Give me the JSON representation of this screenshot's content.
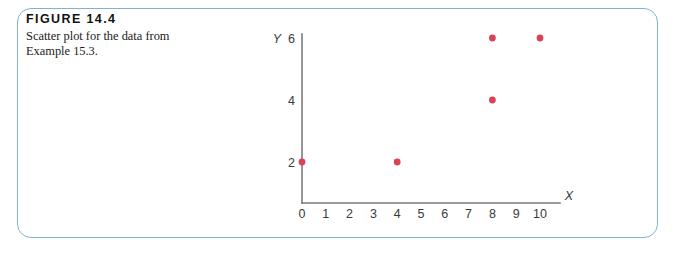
{
  "figure": {
    "number_label": "FIGURE 14.4",
    "caption_line_1": "Scatter plot for the data from",
    "caption_line_2": "Example 15.3.",
    "border_color": "#7fb4cc"
  },
  "chart_data": {
    "type": "scatter",
    "title": "",
    "xlabel": "X",
    "ylabel": "Y",
    "xlim": [
      0,
      10
    ],
    "ylim": [
      0,
      7
    ],
    "grid": false,
    "legend": false,
    "point_color": "#d94455",
    "axis_color": "#7b7b7b",
    "x_tick_labels": [
      "0",
      "1",
      "2",
      "3",
      "4",
      "5",
      "6",
      "7",
      "8",
      "9",
      "10"
    ],
    "x_ticks": [
      0,
      1,
      2,
      3,
      4,
      5,
      6,
      7,
      8,
      9,
      10
    ],
    "y_tick_labels": [
      "2",
      "4",
      "6"
    ],
    "y_ticks": [
      2,
      4,
      6
    ],
    "points": [
      {
        "x": 0,
        "y": 2
      },
      {
        "x": 4,
        "y": 2
      },
      {
        "x": 8,
        "y": 4
      },
      {
        "x": 8,
        "y": 6
      },
      {
        "x": 10,
        "y": 6
      }
    ]
  }
}
